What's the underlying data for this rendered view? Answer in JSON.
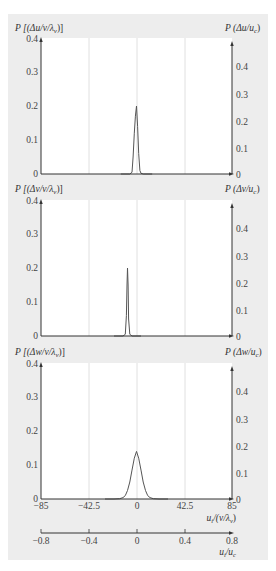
{
  "chart_data": [
    {
      "type": "line",
      "title": "",
      "ylabel_left": "P [(Δu/ν/λ_ν)]",
      "ylabel_right": "P (Δu/u_c)",
      "xlabel": "u_i/(ν/λ_ν)",
      "xlim": [
        -85,
        85
      ],
      "ylim_left": [
        0,
        0.4
      ],
      "yticks_left": [
        0,
        0.1,
        0.2,
        0.3,
        0.4
      ],
      "yticks_right": [
        0,
        0.1,
        0.2,
        0.3,
        0.4
      ],
      "grid_x": [
        -42.5,
        0,
        42.5
      ],
      "peak": {
        "x": 0,
        "y": 0.2
      },
      "x": [
        -6,
        -4,
        -3,
        -2,
        -1,
        0,
        1,
        2,
        3,
        4,
        6
      ],
      "y": [
        0,
        0.005,
        0.05,
        0.12,
        0.17,
        0.2,
        0.14,
        0.06,
        0.01,
        0.002,
        0
      ]
    },
    {
      "type": "line",
      "title": "",
      "ylabel_left": "P [(Δv/ν/λ_ν)]",
      "ylabel_right": "P (Δv/u_c)",
      "xlabel": "u_i/(ν/λ_ν)",
      "xlim": [
        -85,
        85
      ],
      "ylim_left": [
        0,
        0.4
      ],
      "yticks_left": [
        0,
        0.1,
        0.2,
        0.3,
        0.4
      ],
      "yticks_right": [
        0,
        0.1,
        0.2,
        0.3,
        0.4
      ],
      "grid_x": [
        -42.5,
        0,
        42.5
      ],
      "peak": {
        "x": -8,
        "y": 0.2
      },
      "x": [
        -12,
        -10,
        -9,
        -8.5,
        -8,
        -7.5,
        -7,
        -6,
        -4
      ],
      "y": [
        0,
        0.005,
        0.06,
        0.15,
        0.2,
        0.15,
        0.05,
        0.005,
        0
      ]
    },
    {
      "type": "line",
      "title": "",
      "ylabel_left": "P [(Δw/ν/λ_ν)]",
      "ylabel_right": "P (Δw/u_c)",
      "xlabel": "u_i/(ν/λ_ν)",
      "xlabel2": "u_i/u_c",
      "xlim": [
        -85,
        85
      ],
      "xticks": [
        -85,
        -42.5,
        0,
        42.5,
        85
      ],
      "xlim2": [
        -0.8,
        0.8
      ],
      "xticks2": [
        -0.8,
        -0.4,
        0,
        0.4,
        0.8
      ],
      "ylim_left": [
        0,
        0.4
      ],
      "yticks_left": [
        0,
        0.1,
        0.2,
        0.3,
        0.4
      ],
      "yticks_right": [
        0,
        0.1,
        0.2,
        0.3,
        0.4
      ],
      "grid_x": [
        -42.5,
        0,
        42.5
      ],
      "peak": {
        "x": 0,
        "y": 0.14
      },
      "x": [
        -20,
        -15,
        -12,
        -10,
        -8,
        -6,
        -4,
        -2,
        0,
        2,
        4,
        6,
        8,
        10,
        12,
        15,
        20
      ],
      "y": [
        0,
        0.001,
        0.004,
        0.01,
        0.025,
        0.05,
        0.085,
        0.12,
        0.14,
        0.12,
        0.085,
        0.05,
        0.025,
        0.01,
        0.004,
        0.001,
        0
      ]
    }
  ],
  "labels": {
    "p1_left": "P [(Δu/ν/λ",
    "p1_left_sub": "ν",
    "p1_left_end": ")]",
    "p1_right": "P (Δu/u",
    "p1_right_sub": "c",
    "p1_right_end": ")",
    "p2_left": "P [(Δv/ν/λ",
    "p2_left_sub": "ν",
    "p2_left_end": ")]",
    "p2_right": "P (Δv/u",
    "p2_right_sub": "c",
    "p2_right_end": ")",
    "p3_left": "P [(Δw/ν/λ",
    "p3_left_sub": "ν",
    "p3_left_end": ")]",
    "p3_right": "P (Δw/u",
    "p3_right_sub": "c",
    "p3_right_end": ")",
    "xaxis1": "u",
    "xaxis1_sub": "i",
    "xaxis1_end": "/(ν/λ",
    "xaxis1_sub2": "ν",
    "xaxis1_close": ")",
    "xaxis2": "u",
    "xaxis2_sub": "i",
    "xaxis2_mid": "/u",
    "xaxis2_sub2": "c"
  },
  "ticks": {
    "left": [
      "0.4",
      "0.3",
      "0.2",
      "0.1",
      "0"
    ],
    "right": [
      "0.4",
      "0.3",
      "0.2",
      "0.1",
      "0"
    ],
    "x1": [
      "−85",
      "−42.5",
      "0",
      "42.5",
      "85"
    ],
    "x2": [
      "−0.8",
      "−0.4",
      "0",
      "0.4",
      "0.8"
    ]
  }
}
